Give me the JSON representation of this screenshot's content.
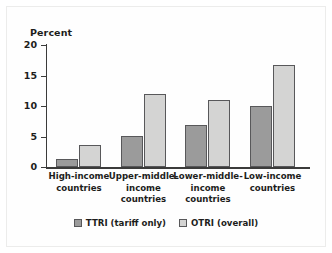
{
  "chart_data": {
    "type": "bar",
    "title": "",
    "xlabel": "",
    "ylabel": "Percent",
    "ylim": [
      0,
      20
    ],
    "yticks": [
      "0",
      "5",
      "10",
      "15",
      "20"
    ],
    "grid": false,
    "legend_position": "bottom-center",
    "categories": [
      "High-income countries",
      "Upper-middle-income countries",
      "Lower-middle-income countries",
      "Low-income countries"
    ],
    "series": [
      {
        "name": "TTRI (tariff only)",
        "color": "#9b9b9b",
        "values": [
          1.3,
          5.1,
          6.9,
          10.0
        ]
      },
      {
        "name": "OTRI (overall)",
        "color": "#d4d4d3",
        "values": [
          3.6,
          12.0,
          11.0,
          16.7
        ]
      }
    ]
  }
}
